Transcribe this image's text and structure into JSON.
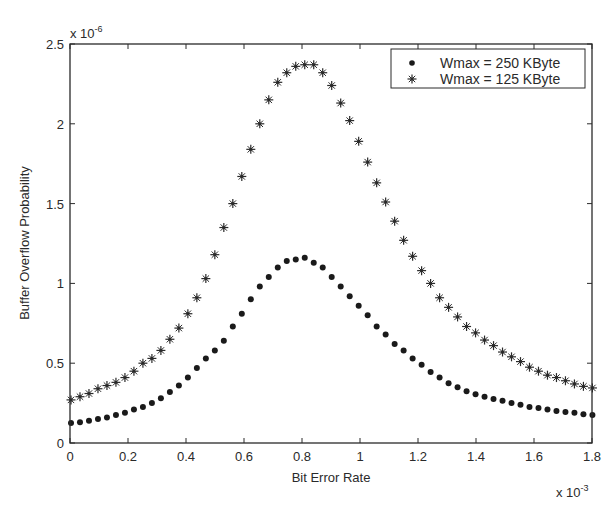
{
  "chart_data": {
    "type": "scatter",
    "title": "",
    "xlabel": "Bit Error Rate",
    "ylabel": "Buffer Overflow Probability",
    "x_scale_label": "x 10",
    "x_scale_exp": "-3",
    "y_scale_label": "x 10",
    "y_scale_exp": "-6",
    "xlim": [
      0,
      1.8
    ],
    "ylim": [
      0,
      2.5
    ],
    "x_ticks": [
      "0",
      "0.2",
      "0.4",
      "0.6",
      "0.8",
      "1",
      "1.2",
      "1.4",
      "1.6",
      "1.8"
    ],
    "y_ticks": [
      "0",
      "0.5",
      "1",
      "1.5",
      "2",
      "2.5"
    ],
    "x_tick_values": [
      0,
      0.2,
      0.4,
      0.6,
      0.8,
      1.0,
      1.2,
      1.4,
      1.6,
      1.8
    ],
    "y_tick_values": [
      0,
      0.5,
      1.0,
      1.5,
      2.0,
      2.5
    ],
    "grid": false,
    "legend_position": "upper right",
    "x_step": 0.031,
    "series": [
      {
        "name": "Wmax = 250 KByte",
        "marker": "dot",
        "values": [
          0.125,
          0.13,
          0.14,
          0.15,
          0.16,
          0.175,
          0.19,
          0.21,
          0.225,
          0.25,
          0.28,
          0.32,
          0.36,
          0.41,
          0.47,
          0.53,
          0.58,
          0.64,
          0.73,
          0.81,
          0.9,
          0.98,
          1.04,
          1.1,
          1.14,
          1.15,
          1.16,
          1.13,
          1.1,
          1.04,
          0.98,
          0.92,
          0.86,
          0.8,
          0.73,
          0.68,
          0.62,
          0.58,
          0.53,
          0.49,
          0.445,
          0.41,
          0.375,
          0.35,
          0.325,
          0.305,
          0.29,
          0.275,
          0.265,
          0.25,
          0.24,
          0.225,
          0.22,
          0.21,
          0.2,
          0.195,
          0.19,
          0.18,
          0.175
        ]
      },
      {
        "name": "Wmax = 125 KByte",
        "marker": "star",
        "values": [
          0.27,
          0.29,
          0.31,
          0.34,
          0.36,
          0.38,
          0.41,
          0.45,
          0.5,
          0.53,
          0.58,
          0.65,
          0.72,
          0.81,
          0.91,
          1.03,
          1.18,
          1.35,
          1.5,
          1.67,
          1.84,
          2.0,
          2.15,
          2.26,
          2.32,
          2.36,
          2.37,
          2.37,
          2.32,
          2.24,
          2.13,
          2.02,
          1.89,
          1.76,
          1.63,
          1.51,
          1.39,
          1.27,
          1.17,
          1.08,
          1.0,
          0.91,
          0.85,
          0.79,
          0.73,
          0.69,
          0.645,
          0.61,
          0.57,
          0.54,
          0.51,
          0.475,
          0.45,
          0.425,
          0.41,
          0.39,
          0.37,
          0.355,
          0.345
        ]
      }
    ]
  },
  "legend": {
    "items": [
      {
        "label": "Wmax = 250 KByte",
        "marker": "dot-icon"
      },
      {
        "label": "Wmax = 125 KByte",
        "marker": "star-icon"
      }
    ]
  },
  "colors": {
    "ink": "#2a2a2a",
    "background": "#ffffff"
  }
}
